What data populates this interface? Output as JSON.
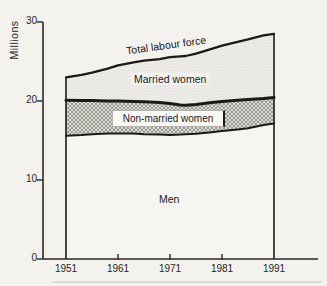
{
  "figure": {
    "y_axis_title": "Millions",
    "y_ticks": [
      "30",
      "20",
      "10",
      "0"
    ],
    "x_ticks": [
      "1951",
      "1961",
      "1971",
      "1981",
      "1991"
    ],
    "labels": {
      "total": "Total labour force",
      "married": "Married women",
      "non_married": "Non-married women",
      "men": "Men"
    }
  },
  "colors": {
    "paper": "#f3f2ee",
    "line": "#1b1a18",
    "axis": "#2a2927",
    "married_band_base": "#f0efeb",
    "married_band_dot": "#c6c5c0",
    "nonmarried_band_base": "#dbd9d3",
    "nonmarried_band_hatch": "#96948b",
    "men_area": "#f6f5f2"
  },
  "chart_data": {
    "type": "area",
    "stacked": true,
    "title": "",
    "xlabel": "",
    "ylabel": "Millions",
    "ylim": [
      0,
      30
    ],
    "xlim": [
      1951,
      1991
    ],
    "grid": false,
    "legend_position": "labels-inside-bands",
    "x_tick_years": [
      1951,
      1961,
      1971,
      1981,
      1991
    ],
    "x": [
      1951,
      1954,
      1956,
      1959,
      1961,
      1964,
      1966,
      1969,
      1971,
      1973,
      1974,
      1976,
      1979,
      1981,
      1984,
      1986,
      1989,
      1991
    ],
    "series": [
      {
        "name": "Men",
        "kind": "cumulative-boundary",
        "cumulative_totals": [
          15.6,
          15.7,
          15.8,
          15.9,
          15.9,
          15.9,
          15.8,
          15.75,
          15.7,
          15.75,
          15.8,
          15.85,
          16.05,
          16.2,
          16.4,
          16.55,
          16.95,
          17.15
        ]
      },
      {
        "name": "Men + Non-married women",
        "kind": "cumulative-boundary",
        "cumulative_totals": [
          20.1,
          20.05,
          20.05,
          20.0,
          20.0,
          19.95,
          19.9,
          19.8,
          19.7,
          19.5,
          19.45,
          19.55,
          19.8,
          19.95,
          20.1,
          20.2,
          20.3,
          20.45
        ]
      },
      {
        "name": "Total labour force",
        "kind": "cumulative-boundary",
        "cumulative_totals": [
          23.0,
          23.3,
          23.6,
          24.1,
          24.5,
          24.9,
          25.1,
          25.3,
          25.55,
          25.65,
          25.7,
          26.0,
          26.6,
          27.0,
          27.5,
          27.8,
          28.3,
          28.5
        ]
      }
    ],
    "decade_summary": {
      "years": [
        1951,
        1961,
        1971,
        1981,
        1991
      ],
      "men": [
        15.6,
        15.9,
        15.7,
        16.2,
        17.15
      ],
      "non_married_women": [
        4.5,
        4.1,
        4.0,
        3.75,
        3.3
      ],
      "married_women": [
        2.9,
        4.5,
        5.85,
        7.05,
        8.05
      ],
      "total_labour_force": [
        23.0,
        24.5,
        25.55,
        27.0,
        28.5
      ]
    }
  }
}
